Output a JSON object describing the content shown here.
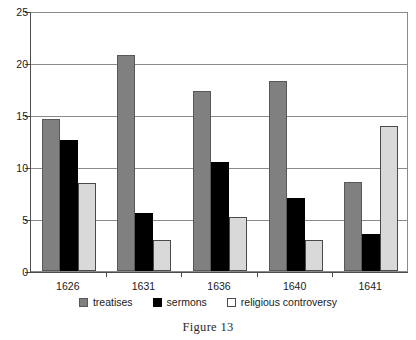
{
  "chart_data": {
    "type": "bar",
    "title": "",
    "subtitle": "",
    "xlabel": "",
    "ylabel": "",
    "categories": [
      "1626",
      "1631",
      "1636",
      "1640",
      "1641"
    ],
    "series": [
      {
        "name": "treatises",
        "color": "#808080",
        "values": [
          14.6,
          20.8,
          17.3,
          18.3,
          8.6
        ]
      },
      {
        "name": "sermons",
        "color": "#000000",
        "values": [
          12.6,
          5.6,
          10.5,
          7.0,
          3.6
        ]
      },
      {
        "name": "religious controversy",
        "color": "#d9d9d9",
        "values": [
          8.5,
          3.0,
          5.2,
          3.0,
          13.9
        ]
      }
    ],
    "ylim": [
      0,
      25
    ],
    "yticks": [
      0,
      5,
      10,
      15,
      20,
      25
    ],
    "ytick_labels": [
      "0",
      "5",
      "10",
      "15",
      "20",
      "25"
    ],
    "grid": true,
    "grid_axis": "y",
    "legend_position": "bottom",
    "bar_group_style": "clustered"
  },
  "caption": {
    "text": "Figure 13"
  },
  "legend": {
    "entries": [
      {
        "label": "treatises",
        "swatch": "legend-swatch-treatises"
      },
      {
        "label": "sermons",
        "swatch": "legend-swatch-sermons"
      },
      {
        "label": "religious controversy",
        "swatch": "legend-swatch-religious-controversy"
      }
    ]
  },
  "colors": {
    "treatises": "#808080",
    "sermons": "#000000",
    "religious_controversy": "#d9d9d9",
    "grid": "#8a8a8a",
    "axis": "#4d4d4d",
    "background": "#ffffff",
    "text": "#1a1a1a"
  }
}
